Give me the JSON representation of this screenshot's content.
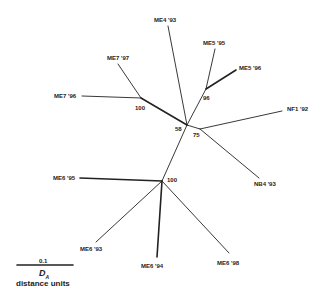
{
  "diagram": {
    "type": "unrooted phylogenetic tree",
    "line_color": "#222222",
    "nodes": {
      "A": {
        "x": 141,
        "y": 98
      },
      "B": {
        "x": 187,
        "y": 125
      },
      "C": {
        "x": 206,
        "y": 89
      },
      "D": {
        "x": 200,
        "y": 129
      },
      "E": {
        "x": 162,
        "y": 181
      }
    },
    "leaves": [
      {
        "label": "ME4 '93",
        "x": 168,
        "y": 26,
        "lx": 154,
        "ly": 17,
        "from": "B"
      },
      {
        "label": "ME5 '95",
        "x": 215,
        "y": 49,
        "lx": 203,
        "ly": 40,
        "from": "C"
      },
      {
        "label": "ME5 '96",
        "x": 236,
        "y": 70,
        "lx": 239,
        "ly": 65,
        "from": "C",
        "thick": true
      },
      {
        "label": "NF1 '92",
        "x": 282,
        "y": 111,
        "lx": 287,
        "ly": 106,
        "from": "D"
      },
      {
        "label": "NB4 '93",
        "x": 259,
        "y": 178,
        "lx": 254,
        "ly": 181,
        "from": "D"
      },
      {
        "label": "ME6 '98",
        "x": 229,
        "y": 253,
        "lx": 217,
        "ly": 260,
        "from": "E"
      },
      {
        "label": "ME6 '94",
        "x": 157,
        "y": 257,
        "lx": 141,
        "ly": 263,
        "from": "E",
        "thick": true
      },
      {
        "label": "ME6 '93",
        "x": 96,
        "y": 242,
        "lx": 80,
        "ly": 246,
        "from": "E"
      },
      {
        "label": "ME6 '95",
        "x": 80,
        "y": 178,
        "lx": 53,
        "ly": 175,
        "from": "E",
        "thick": true
      },
      {
        "label": "ME7 '96",
        "x": 82,
        "y": 96,
        "lx": 54,
        "ly": 93,
        "from": "A"
      },
      {
        "label": "ME7 '97",
        "x": 118,
        "y": 64,
        "lx": 107,
        "ly": 55,
        "from": "A"
      }
    ],
    "internal_edges": [
      {
        "from": "A",
        "to": "B",
        "thick": true
      },
      {
        "from": "B",
        "to": "C"
      },
      {
        "from": "B",
        "to": "D"
      },
      {
        "from": "B",
        "to": "E"
      }
    ],
    "bootstrap": [
      {
        "value": "100",
        "x": 135,
        "y": 105
      },
      {
        "value": "58",
        "x": 175,
        "y": 126
      },
      {
        "value": "96",
        "x": 203,
        "y": 95
      },
      {
        "value": "75",
        "x": 193,
        "y": 132
      },
      {
        "value": "100",
        "x": 167,
        "y": 177
      }
    ],
    "scale_bar": {
      "value": "0.1",
      "symbol": "D",
      "subscript": "A",
      "units": "distance units",
      "x1": 17,
      "x2": 73,
      "y": 265
    }
  }
}
